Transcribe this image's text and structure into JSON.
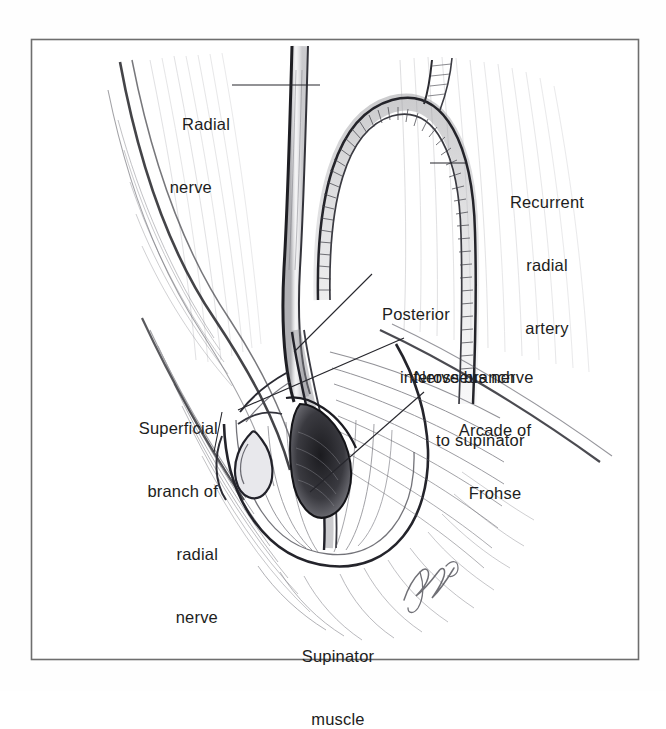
{
  "figure": {
    "style": "pencil line drawing, grayscale",
    "border_color": "#6e6e6e",
    "ink_color": "#1d1d21",
    "background_color": "#fefefe",
    "caption": {
      "line1": "Supinator",
      "line2": "muscle"
    },
    "signature": "artist-signature",
    "labels": [
      {
        "id": "radial-nerve",
        "lines": [
          "Radial",
          "nerve"
        ],
        "align": "right",
        "x": 120,
        "y": 72,
        "width": 110,
        "leader": {
          "x1": 232,
          "y1": 85,
          "x2": 320,
          "y2": 85
        }
      },
      {
        "id": "recurrent-radial-artery",
        "lines": [
          "Recurrent",
          "radial",
          "artery"
        ],
        "align": "center",
        "x": 472,
        "y": 150,
        "width": 150,
        "leader": {
          "x1": 430,
          "y1": 163,
          "x2": 466,
          "y2": 163
        }
      },
      {
        "id": "posterior-interosseus-nerve",
        "lines": [
          "Posterior",
          "interosseus nerve"
        ],
        "align": "left",
        "x": 382,
        "y": 262,
        "width": 190,
        "indent": 22,
        "leader": {
          "x1": 372,
          "y1": 274,
          "x2": 294,
          "y2": 352
        }
      },
      {
        "id": "nerve-branch-to-supinator",
        "lines": [
          "Nerve branch",
          "to supinator"
        ],
        "align": "left",
        "x": 414,
        "y": 325,
        "width": 170,
        "indent": 24,
        "leader": {
          "x1": 404,
          "y1": 338,
          "x2": 238,
          "y2": 410
        }
      },
      {
        "id": "arcade-of-frohse",
        "lines": [
          "Arcade of",
          "Frohse"
        ],
        "align": "center",
        "x": 430,
        "y": 378,
        "width": 130,
        "leader": {
          "x1": 424,
          "y1": 392,
          "x2": 310,
          "y2": 492
        }
      },
      {
        "id": "superficial-branch-of-radial-nerve",
        "lines": [
          "Superficial",
          "branch of",
          "radial",
          "nerve"
        ],
        "align": "right",
        "x": 96,
        "y": 376,
        "width": 122,
        "leader": {
          "x1": 222,
          "y1": 412,
          "x2": 214,
          "y2": 452
        }
      }
    ]
  }
}
